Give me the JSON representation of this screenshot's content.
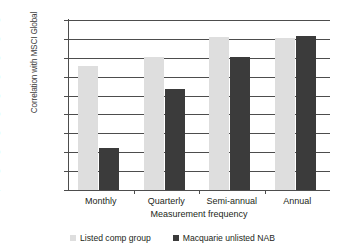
{
  "chart_data": {
    "type": "bar",
    "title": "",
    "xlabel": "Measurement frequency",
    "ylabel": "Correlation with MSCI Global",
    "categories": [
      "Monthly",
      "Quarterly",
      "Semi-annual",
      "Annual"
    ],
    "series": [
      {
        "name": "Listed comp group",
        "color": "#dedede",
        "values": [
          0.655,
          0.705,
          0.81,
          0.805
        ]
      },
      {
        "name": "Macquarie unlisted NAB",
        "color": "#3b3b3b",
        "values": [
          0.22,
          0.535,
          0.705,
          0.815
        ]
      }
    ],
    "ylim": [
      0,
      0.9
    ],
    "ytick_values": [
      0,
      0.1,
      0.2,
      0.3,
      0.4,
      0.5,
      0.6,
      0.7,
      0.8,
      0.9
    ],
    "ytick_labels": [
      "-",
      "0.10",
      "0.20",
      "0.30",
      "0.40",
      "0.50",
      "0.60",
      "0.70",
      "0.80",
      "0.90"
    ],
    "grid": true,
    "legend_position": "bottom"
  },
  "axes": {
    "y_title": "Correlation with MSCI Global",
    "x_title": "Measurement frequency"
  },
  "legend": {
    "entries": [
      {
        "label": "Listed comp group",
        "swatch": "legend-swatch-listed"
      },
      {
        "label": "Macquarie unlisted NAB",
        "swatch": "legend-swatch-unlisted"
      }
    ]
  }
}
